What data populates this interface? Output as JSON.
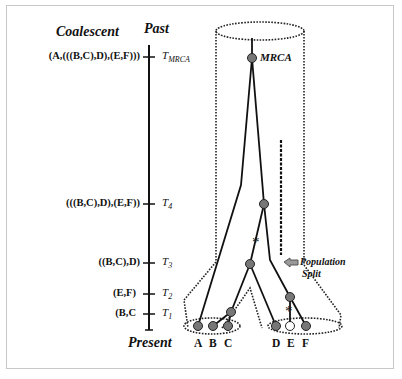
{
  "figure": {
    "headings": {
      "left": "Coalescent",
      "top": "Past",
      "bottom": "Present"
    },
    "timeline": [
      {
        "newick": "(A,(((B,C),D),(E,F)))",
        "time_base": "T",
        "time_sub": "MRCA",
        "y": 57
      },
      {
        "newick": "(((B,C),D),(E,F))",
        "time_base": "T",
        "time_sub": "4",
        "y": 204
      },
      {
        "newick": "((B,C),D)",
        "time_base": "T",
        "time_sub": "3",
        "y": 263
      },
      {
        "newick": "(E,F)",
        "time_base": "T",
        "time_sub": "2",
        "y": 294
      },
      {
        "newick": "(B,C",
        "time_base": "T",
        "time_sub": "1",
        "y": 314
      }
    ],
    "tree": {
      "root_label": "MRCA",
      "leaves": [
        "A",
        "B",
        "C",
        "D",
        "E",
        "F"
      ],
      "annotation": {
        "line1": "Population",
        "line2": "Split"
      },
      "mutation_marker": "*"
    },
    "colors": {
      "node_fill": "#777777",
      "line": "#111111",
      "frame": "#c8c8c8",
      "arrow": "#888888"
    }
  }
}
